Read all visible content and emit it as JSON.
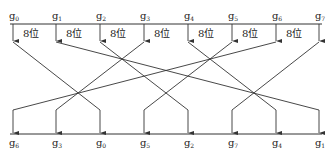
{
  "diagram": {
    "title": "",
    "top_labels": [
      {
        "base": "g",
        "sub": "0"
      },
      {
        "base": "g",
        "sub": "1"
      },
      {
        "base": "g",
        "sub": "2"
      },
      {
        "base": "g",
        "sub": "3"
      },
      {
        "base": "g",
        "sub": "4"
      },
      {
        "base": "g",
        "sub": "5"
      },
      {
        "base": "g",
        "sub": "6"
      },
      {
        "base": "g",
        "sub": "7"
      }
    ],
    "bit_width_label": "8位",
    "bit_width_label_count": 7,
    "bottom_labels": [
      {
        "base": "g",
        "sub": "6"
      },
      {
        "base": "g",
        "sub": "3"
      },
      {
        "base": "g",
        "sub": "0"
      },
      {
        "base": "g",
        "sub": "5"
      },
      {
        "base": "g",
        "sub": "2"
      },
      {
        "base": "g",
        "sub": "7"
      },
      {
        "base": "g",
        "sub": "4"
      },
      {
        "base": "g",
        "sub": "1"
      }
    ],
    "permutation": {
      "g0": "g0",
      "g1": "g1",
      "g2": "g2",
      "g3": "g3",
      "g4": "g4",
      "g5": "g5",
      "g6": "g6",
      "g7": "g7"
    },
    "mapping_top_to_bottom_index": [
      2,
      7,
      4,
      1,
      6,
      3,
      0,
      5
    ]
  }
}
